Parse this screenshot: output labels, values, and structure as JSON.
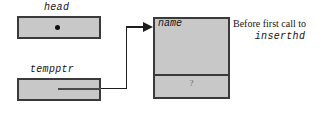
{
  "diagram": {
    "title_caption": {
      "line1": "Before first call to",
      "line2": "inserthd"
    },
    "variables": [
      {
        "name": "head",
        "label": "head",
        "content": "dot",
        "description": "pointer variable box containing a dot"
      },
      {
        "name": "tempptr",
        "label": "tempptr",
        "content": "pointer-line",
        "description": "pointer variable box containing a pointer line to node"
      }
    ],
    "node": {
      "field_label": "name",
      "next_field": "?"
    },
    "colors": {
      "box_fill": "#c8c8c8",
      "box_border": "#3a3a3a",
      "wire": "#1d1d1d",
      "text": "#151515",
      "background": "#ffffff"
    }
  }
}
